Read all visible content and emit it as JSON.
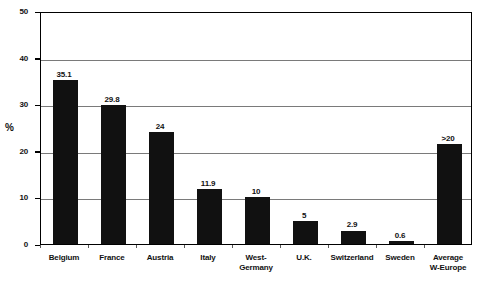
{
  "chart_data": {
    "type": "bar",
    "title": "",
    "subtitle": "",
    "xlabel": "",
    "ylabel": "%",
    "ylim": [
      0,
      50
    ],
    "ytick_labels": [
      "0",
      "10",
      "20",
      "30",
      "40",
      "50"
    ],
    "ytick_values": [
      0,
      10,
      20,
      30,
      40,
      50
    ],
    "grid": true,
    "grid_axis": "y",
    "legend": false,
    "legend_position": "none",
    "bar_color": "#111111",
    "categories": [
      "Belgium",
      "France",
      "Austria",
      "Italy",
      "West-\nGermany",
      "U.K.",
      "Switzerland",
      "Sweden",
      "Average\nW-Europe"
    ],
    "values": [
      35.1,
      29.8,
      24,
      11.9,
      10,
      5,
      2.9,
      0.6,
      21.5
    ],
    "data_labels": [
      "35.1",
      "29.8",
      "24",
      "11.9",
      "10",
      "5",
      "2.9",
      "0.6",
      ">20"
    ]
  }
}
